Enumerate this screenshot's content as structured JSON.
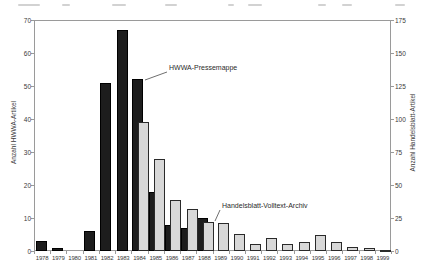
{
  "figure": {
    "left_axis_label": "Anzahl HWWA-Artikel",
    "right_axis_label": "Anzahl Handelsblatt-Artikel",
    "annotations": {
      "hwwa": "HWWA-Pressemappe",
      "handelsblatt": "Handelsblatt-Volltext-Archiv"
    }
  },
  "chart_data": {
    "type": "bar",
    "title": "",
    "categories": [
      "1978",
      "1979",
      "1980",
      "1981",
      "1982",
      "1983",
      "1984",
      "1985",
      "1986",
      "1987",
      "1988",
      "1989",
      "1990",
      "1991",
      "1992",
      "1993",
      "1994",
      "1995",
      "1996",
      "1997",
      "1998",
      "1999"
    ],
    "series": [
      {
        "name": "HWWA-Pressemappe",
        "axis": "left",
        "color": "#1d1d1d",
        "values": [
          3,
          1,
          0,
          6,
          51,
          67,
          52,
          18,
          8,
          7,
          10,
          0,
          0,
          0,
          0,
          0,
          0,
          0,
          0,
          0,
          0,
          0
        ]
      },
      {
        "name": "Handelsblatt-Volltext-Archiv",
        "axis": "right",
        "color": "#d8d8d8",
        "values": [
          0,
          0,
          0,
          0,
          0,
          0,
          98,
          70,
          39,
          32,
          22,
          21,
          13,
          5,
          10,
          5,
          7,
          12,
          7,
          3,
          2,
          1
        ]
      }
    ],
    "left_axis": {
      "label": "Anzahl HWWA-Artikel",
      "range": [
        0,
        70
      ],
      "ticks": [
        0,
        10,
        20,
        30,
        40,
        50,
        60,
        70
      ]
    },
    "right_axis": {
      "label": "Anzahl Handelsblatt-Artikel",
      "range": [
        0,
        175
      ],
      "ticks": [
        0,
        25,
        50,
        75,
        100,
        125,
        150,
        175
      ]
    },
    "xlabel": "",
    "ylabel_left": "Anzahl HWWA-Artikel",
    "ylabel_right": "Anzahl Handelsblatt-Artikel",
    "grid": false,
    "legend_position": "none",
    "annotations": [
      {
        "text": "HWWA-Pressemappe",
        "points_to_year": "1984",
        "points_to_series": "HWWA-Pressemappe"
      },
      {
        "text": "Handelsblatt-Volltext-Archiv",
        "points_to_year": "1989",
        "points_to_series": "Handelsblatt-Volltext-Archiv"
      }
    ]
  }
}
